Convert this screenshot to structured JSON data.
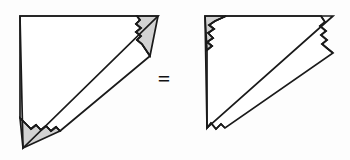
{
  "figure": {
    "background_color": "#fdfdfd",
    "stroke_color": "#1a1a1a",
    "shaded_fill_color": "#d2d2d2",
    "unshaded_fill_color": "#ffffff",
    "relation_symbol": "=",
    "left_shape": {
      "name": "left-triangle",
      "description": "right triangle, right angle at top-left, with two shaded corner sub-triangles cut along jagged edges",
      "outline_points": "20,16 158,16 23,148",
      "shaded_pieces": 2,
      "jagged_edges": 2
    },
    "right_shape": {
      "name": "right-triangle",
      "description": "right triangle reassembled, right angle at top-left, one shaded corner sub-triangle at top-left, jagged edges on right and bottom",
      "outline_points": "205,16 333,16 207,128",
      "shaded_pieces": 1,
      "jagged_edges": 2
    }
  }
}
